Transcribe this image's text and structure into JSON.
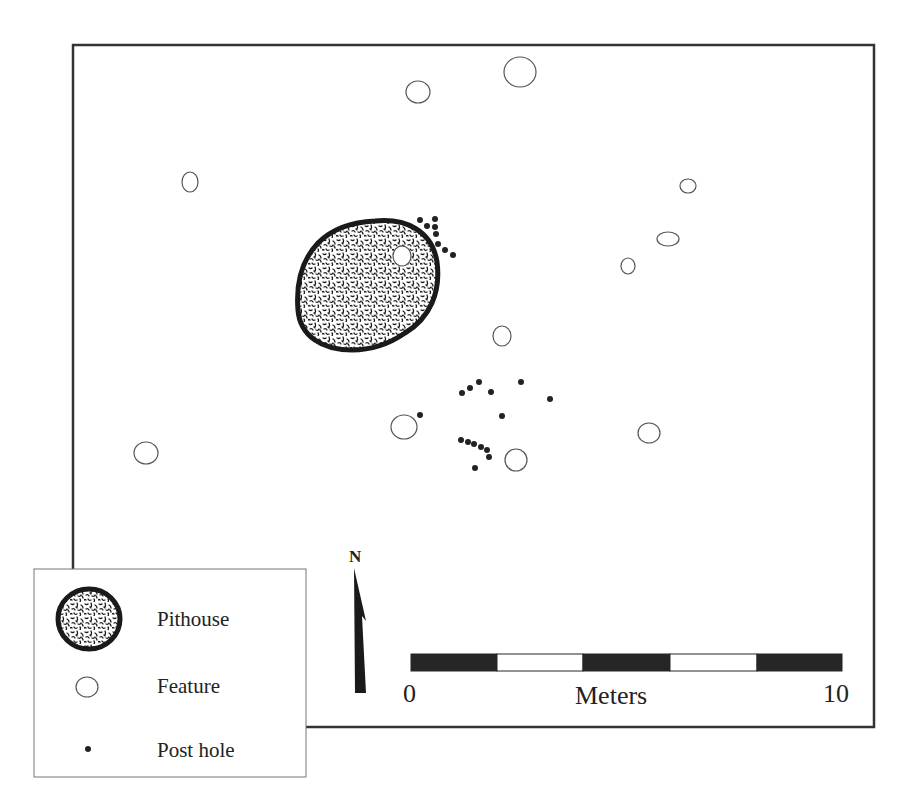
{
  "map": {
    "type": "archaeological-site-plan",
    "frame": {
      "x1": 73,
      "y1": 45,
      "x2": 874,
      "y2": 727
    },
    "pithouse": {
      "label": "Pithouse",
      "inner_feature": {
        "cx": 402,
        "cy": 256,
        "rx": 9,
        "ry": 10
      }
    },
    "features": [
      {
        "cx": 418,
        "cy": 92,
        "rx": 12,
        "ry": 11
      },
      {
        "cx": 520,
        "cy": 72,
        "rx": 16,
        "ry": 15
      },
      {
        "cx": 190,
        "cy": 182,
        "rx": 8,
        "ry": 10
      },
      {
        "cx": 688,
        "cy": 186,
        "rx": 8,
        "ry": 7
      },
      {
        "cx": 668,
        "cy": 239,
        "rx": 11,
        "ry": 7
      },
      {
        "cx": 628,
        "cy": 266,
        "rx": 7,
        "ry": 8
      },
      {
        "cx": 502,
        "cy": 336,
        "rx": 9,
        "ry": 10
      },
      {
        "cx": 404,
        "cy": 427,
        "rx": 13,
        "ry": 12
      },
      {
        "cx": 649,
        "cy": 433,
        "rx": 11,
        "ry": 10
      },
      {
        "cx": 516,
        "cy": 460,
        "rx": 11,
        "ry": 11
      },
      {
        "cx": 146,
        "cy": 453,
        "rx": 12,
        "ry": 11
      }
    ],
    "post_holes": [
      {
        "cx": 420,
        "cy": 220
      },
      {
        "cx": 427,
        "cy": 226
      },
      {
        "cx": 435,
        "cy": 219
      },
      {
        "cx": 435,
        "cy": 227
      },
      {
        "cx": 436,
        "cy": 234
      },
      {
        "cx": 438,
        "cy": 244
      },
      {
        "cx": 445,
        "cy": 250
      },
      {
        "cx": 453,
        "cy": 255
      },
      {
        "cx": 462,
        "cy": 393
      },
      {
        "cx": 470,
        "cy": 388
      },
      {
        "cx": 479,
        "cy": 382
      },
      {
        "cx": 491,
        "cy": 392
      },
      {
        "cx": 521,
        "cy": 382
      },
      {
        "cx": 550,
        "cy": 399
      },
      {
        "cx": 502,
        "cy": 416
      },
      {
        "cx": 420,
        "cy": 415
      },
      {
        "cx": 461,
        "cy": 440
      },
      {
        "cx": 468,
        "cy": 442
      },
      {
        "cx": 474,
        "cy": 444
      },
      {
        "cx": 481,
        "cy": 447
      },
      {
        "cx": 487,
        "cy": 450
      },
      {
        "cx": 489,
        "cy": 457
      },
      {
        "cx": 475,
        "cy": 468
      }
    ]
  },
  "north_arrow": {
    "label": "N"
  },
  "scale_bar": {
    "start_label": "0",
    "end_label": "10",
    "unit_label": "Meters",
    "segments": 5
  },
  "legend": {
    "items": [
      {
        "symbol": "pithouse",
        "label": "Pithouse"
      },
      {
        "symbol": "feature",
        "label": "Feature"
      },
      {
        "symbol": "post-hole",
        "label": "Post hole"
      }
    ]
  },
  "colors": {
    "ink": "#1a1a1a",
    "feature_stroke": "#555555",
    "background": "#ffffff"
  }
}
